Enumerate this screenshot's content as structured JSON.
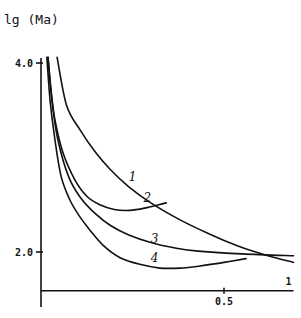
{
  "chart_data": {
    "type": "line",
    "title": "",
    "ylabel": "lg (Ma)",
    "xlabel": "",
    "x_axis_end_label": "1",
    "xlim": [
      0,
      0.69
    ],
    "ylim": [
      1.59,
      4.1
    ],
    "x_ticks": [
      {
        "value": 0.5,
        "label": "0.5"
      }
    ],
    "y_ticks": [
      {
        "value": 4.0,
        "label": "4.0"
      },
      {
        "value": 2.0,
        "label": "2.0"
      }
    ],
    "grid": false,
    "legend": "none (curves labeled inline)",
    "series": [
      {
        "name": "1",
        "points": [
          [
            0.044,
            4.06
          ],
          [
            0.07,
            3.55
          ],
          [
            0.107,
            3.29
          ],
          [
            0.15,
            3.05
          ],
          [
            0.19,
            2.87
          ],
          [
            0.24,
            2.69
          ],
          [
            0.3,
            2.52
          ],
          [
            0.38,
            2.34
          ],
          [
            0.46,
            2.19
          ],
          [
            0.54,
            2.06
          ],
          [
            0.62,
            1.96
          ],
          [
            0.69,
            1.89
          ]
        ],
        "label_at": [
          0.24,
          2.75
        ]
      },
      {
        "name": "2",
        "points": [
          [
            0.019,
            4.06
          ],
          [
            0.028,
            3.7
          ],
          [
            0.038,
            3.4
          ],
          [
            0.06,
            3.05
          ],
          [
            0.093,
            2.76
          ],
          [
            0.125,
            2.59
          ],
          [
            0.161,
            2.5
          ],
          [
            0.2,
            2.45
          ],
          [
            0.243,
            2.44
          ],
          [
            0.29,
            2.47
          ],
          [
            0.342,
            2.52
          ]
        ],
        "label_at": [
          0.28,
          2.53
        ]
      },
      {
        "name": "3",
        "points": [
          [
            0.019,
            4.06
          ],
          [
            0.03,
            3.6
          ],
          [
            0.046,
            3.19
          ],
          [
            0.075,
            2.8
          ],
          [
            0.107,
            2.58
          ],
          [
            0.15,
            2.4
          ],
          [
            0.19,
            2.28
          ],
          [
            0.24,
            2.18
          ],
          [
            0.3,
            2.1
          ],
          [
            0.37,
            2.04
          ],
          [
            0.43,
            2.01
          ],
          [
            0.55,
            1.98
          ],
          [
            0.69,
            1.96
          ]
        ],
        "label_at": [
          0.3,
          2.1
        ]
      },
      {
        "name": "4",
        "points": [
          [
            0.016,
            4.06
          ],
          [
            0.025,
            3.6
          ],
          [
            0.038,
            3.19
          ],
          [
            0.055,
            2.8
          ],
          [
            0.079,
            2.55
          ],
          [
            0.105,
            2.38
          ],
          [
            0.134,
            2.23
          ],
          [
            0.17,
            2.07
          ],
          [
            0.216,
            1.94
          ],
          [
            0.27,
            1.87
          ],
          [
            0.325,
            1.83
          ],
          [
            0.38,
            1.83
          ],
          [
            0.43,
            1.85
          ],
          [
            0.5,
            1.89
          ],
          [
            0.56,
            1.93
          ]
        ],
        "label_at": [
          0.3,
          1.89
        ]
      }
    ]
  }
}
